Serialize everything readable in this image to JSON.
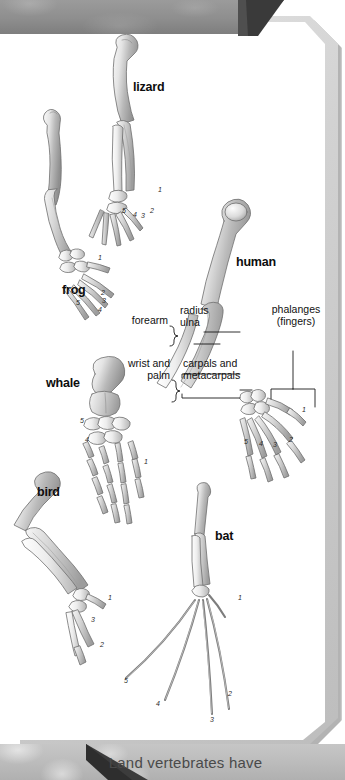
{
  "figure": {
    "caption": "Land vertebrates have"
  },
  "specimens": [
    {
      "name": "frog",
      "label": "frog",
      "digits": [
        "1",
        "2",
        "3",
        "4",
        "5"
      ]
    },
    {
      "name": "lizard",
      "label": "lizard",
      "digits": [
        "1",
        "2",
        "3",
        "4",
        "5"
      ]
    },
    {
      "name": "human",
      "label": "human",
      "digits": [
        "1",
        "2",
        "3",
        "4",
        "5"
      ]
    },
    {
      "name": "whale",
      "label": "whale",
      "digits": [
        "1",
        "2",
        "3",
        "4",
        "5"
      ]
    },
    {
      "name": "bird",
      "label": "bird",
      "digits": [
        "1",
        "2",
        "3"
      ]
    },
    {
      "name": "bat",
      "label": "bat",
      "digits": [
        "1",
        "2",
        "3",
        "4",
        "5"
      ]
    }
  ],
  "annotations": {
    "forearm": "forearm",
    "radius": "radius",
    "ulna": "ulna",
    "wrist_palm_line1": "wrist and",
    "wrist_palm_line2": "palm",
    "carpals": "carpals and",
    "metacarpals": "metacarpals",
    "phalanges_line1": "phalanges",
    "phalanges_line2": "(fingers)"
  },
  "digit_numbers": {
    "frog": {
      "d1": "1",
      "d2": "2",
      "d3": "3",
      "d4": "4",
      "d5": "5"
    },
    "lizard": {
      "d1": "1",
      "d2": "2",
      "d3": "3",
      "d4": "4",
      "d5": "5"
    },
    "human": {
      "d1": "1",
      "d2": "2",
      "d3": "3",
      "d4": "4",
      "d5": "5"
    },
    "whale": {
      "d1": "1",
      "d4": "4",
      "d5": "5"
    },
    "bird": {
      "d1": "1",
      "d2": "2",
      "d3": "3"
    },
    "bat": {
      "d1": "1",
      "d2": "2",
      "d3": "3",
      "d4": "4",
      "d5": "5"
    }
  },
  "colors": {
    "bone_light": "#f2f2f2",
    "bone_mid": "#cfcfcf",
    "bone_dark": "#9a9a9a",
    "outline": "#6e6e6e",
    "frame": "#d2d2d2",
    "band": "#8e8e8e",
    "caption_text": "#4a4a4a"
  }
}
